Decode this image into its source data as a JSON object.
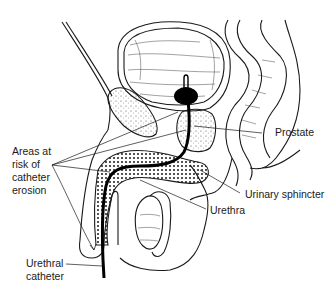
{
  "diagram": {
    "labels": {
      "areas_at_risk": [
        "Areas at",
        "risk of",
        "catheter",
        "erosion"
      ],
      "prostate": "Prostate",
      "urinary_sphincter": "Urinary sphincter",
      "urethra": "Urethra",
      "urethral_catheter": [
        "Urethral",
        "catheter"
      ]
    },
    "colors": {
      "line": "#1a1a1a",
      "background": "#ffffff",
      "catheter": "#000000"
    }
  }
}
